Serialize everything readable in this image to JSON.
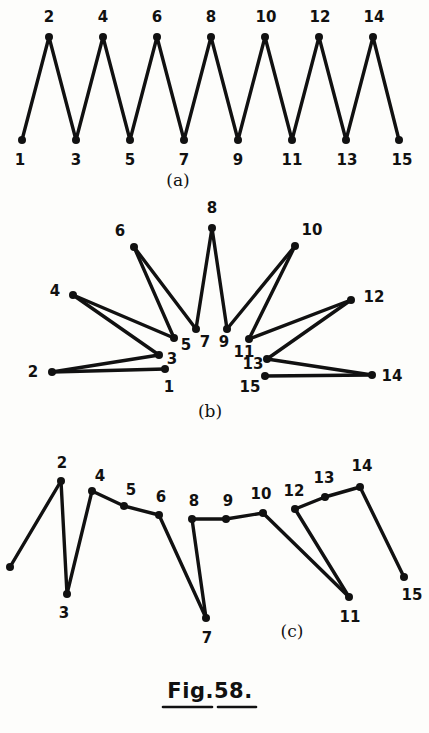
{
  "figure": {
    "caption": "Fig.58.",
    "caption_underlined": true,
    "background_color": "#fdfdfb",
    "ink_color": "#111111",
    "style": "hand-drawn pen sketch",
    "panels": [
      {
        "id": "a",
        "caption": "(a)",
        "caption_pos": [
          178,
          181
        ],
        "description": "zigzag path 1-2-3-...-15, odd vertices on lower row, even vertices on upper row",
        "nodes": [
          {
            "label": "1",
            "x": 22,
            "y": 140,
            "label_x": 20,
            "label_y": 160
          },
          {
            "label": "2",
            "x": 49,
            "y": 37,
            "label_x": 49,
            "label_y": 17
          },
          {
            "label": "3",
            "x": 76,
            "y": 140,
            "label_x": 76,
            "label_y": 160
          },
          {
            "label": "4",
            "x": 103,
            "y": 37,
            "label_x": 103,
            "label_y": 17
          },
          {
            "label": "5",
            "x": 130,
            "y": 140,
            "label_x": 130,
            "label_y": 160
          },
          {
            "label": "6",
            "x": 157,
            "y": 37,
            "label_x": 157,
            "label_y": 17
          },
          {
            "label": "7",
            "x": 184,
            "y": 140,
            "label_x": 184,
            "label_y": 160
          },
          {
            "label": "8",
            "x": 211,
            "y": 37,
            "label_x": 211,
            "label_y": 17
          },
          {
            "label": "9",
            "x": 238,
            "y": 140,
            "label_x": 238,
            "label_y": 160
          },
          {
            "label": "10",
            "x": 265,
            "y": 37,
            "label_x": 266,
            "label_y": 17
          },
          {
            "label": "11",
            "x": 292,
            "y": 140,
            "label_x": 292,
            "label_y": 160
          },
          {
            "label": "12",
            "x": 319,
            "y": 37,
            "label_x": 320,
            "label_y": 17
          },
          {
            "label": "13",
            "x": 346,
            "y": 140,
            "label_x": 347,
            "label_y": 160
          },
          {
            "label": "14",
            "x": 373,
            "y": 37,
            "label_x": 374,
            "label_y": 17
          },
          {
            "label": "15",
            "x": 399,
            "y": 140,
            "label_x": 402,
            "label_y": 160
          }
        ],
        "edges": [
          [
            "1",
            "2"
          ],
          [
            "2",
            "3"
          ],
          [
            "3",
            "4"
          ],
          [
            "4",
            "5"
          ],
          [
            "5",
            "6"
          ],
          [
            "6",
            "7"
          ],
          [
            "7",
            "8"
          ],
          [
            "8",
            "9"
          ],
          [
            "9",
            "10"
          ],
          [
            "10",
            "11"
          ],
          [
            "11",
            "12"
          ],
          [
            "12",
            "13"
          ],
          [
            "13",
            "14"
          ],
          [
            "14",
            "15"
          ]
        ]
      },
      {
        "id": "b",
        "caption": "(b)",
        "caption_pos": [
          210,
          412
        ],
        "description": "same path 1-2-...-15 redrawn as a radial fan; odd vertices clustered near centre, even vertices splayed outward",
        "nodes": [
          {
            "label": "1",
            "x": 165,
            "y": 369,
            "label_x": 169,
            "label_y": 387
          },
          {
            "label": "2",
            "x": 52,
            "y": 372,
            "label_x": 33,
            "label_y": 372
          },
          {
            "label": "3",
            "x": 159,
            "y": 355,
            "label_x": 172,
            "label_y": 359
          },
          {
            "label": "4",
            "x": 73,
            "y": 295,
            "label_x": 55,
            "label_y": 291
          },
          {
            "label": "5",
            "x": 174,
            "y": 338,
            "label_x": 186,
            "label_y": 345
          },
          {
            "label": "6",
            "x": 134,
            "y": 247,
            "label_x": 120,
            "label_y": 231
          },
          {
            "label": "7",
            "x": 196,
            "y": 329,
            "label_x": 205,
            "label_y": 342
          },
          {
            "label": "8",
            "x": 212,
            "y": 228,
            "label_x": 212,
            "label_y": 208
          },
          {
            "label": "9",
            "x": 227,
            "y": 329,
            "label_x": 224,
            "label_y": 342
          },
          {
            "label": "10",
            "x": 295,
            "y": 246,
            "label_x": 312,
            "label_y": 230
          },
          {
            "label": "11",
            "x": 249,
            "y": 339,
            "label_x": 244,
            "label_y": 352
          },
          {
            "label": "12",
            "x": 351,
            "y": 300,
            "label_x": 374,
            "label_y": 297
          },
          {
            "label": "13",
            "x": 267,
            "y": 359,
            "label_x": 253,
            "label_y": 364
          },
          {
            "label": "14",
            "x": 372,
            "y": 375,
            "label_x": 392,
            "label_y": 376
          },
          {
            "label": "15",
            "x": 265,
            "y": 376,
            "label_x": 250,
            "label_y": 387
          }
        ],
        "edges": [
          [
            "1",
            "2"
          ],
          [
            "2",
            "3"
          ],
          [
            "3",
            "4"
          ],
          [
            "4",
            "5"
          ],
          [
            "5",
            "6"
          ],
          [
            "6",
            "7"
          ],
          [
            "7",
            "8"
          ],
          [
            "8",
            "9"
          ],
          [
            "9",
            "10"
          ],
          [
            "10",
            "11"
          ],
          [
            "11",
            "12"
          ],
          [
            "12",
            "13"
          ],
          [
            "13",
            "14"
          ],
          [
            "14",
            "15"
          ]
        ]
      },
      {
        "id": "c",
        "caption": "(c)",
        "caption_pos": [
          292,
          632
        ],
        "description": "same path redrawn with three deep vertices 3, 7 and 11 acting as fan hubs",
        "nodes": [
          {
            "label": "1",
            "x": 10,
            "y": 567,
            "label_x": -6,
            "label_y": 585
          },
          {
            "label": "2",
            "x": 61,
            "y": 481,
            "label_x": 62,
            "label_y": 463
          },
          {
            "label": "3",
            "x": 67,
            "y": 594,
            "label_x": 64,
            "label_y": 613
          },
          {
            "label": "4",
            "x": 92,
            "y": 491,
            "label_x": 100,
            "label_y": 476
          },
          {
            "label": "5",
            "x": 124,
            "y": 506,
            "label_x": 131,
            "label_y": 490
          },
          {
            "label": "6",
            "x": 159,
            "y": 515,
            "label_x": 161,
            "label_y": 497
          },
          {
            "label": "7",
            "x": 206,
            "y": 618,
            "label_x": 207,
            "label_y": 638
          },
          {
            "label": "8",
            "x": 192,
            "y": 519,
            "label_x": 194,
            "label_y": 501
          },
          {
            "label": "9",
            "x": 226,
            "y": 519,
            "label_x": 228,
            "label_y": 501
          },
          {
            "label": "10",
            "x": 263,
            "y": 513,
            "label_x": 261,
            "label_y": 494
          },
          {
            "label": "11",
            "x": 349,
            "y": 597,
            "label_x": 350,
            "label_y": 617
          },
          {
            "label": "12",
            "x": 295,
            "y": 509,
            "label_x": 294,
            "label_y": 491
          },
          {
            "label": "13",
            "x": 325,
            "y": 497,
            "label_x": 324,
            "label_y": 478
          },
          {
            "label": "14",
            "x": 360,
            "y": 487,
            "label_x": 362,
            "label_y": 466
          },
          {
            "label": "15",
            "x": 404,
            "y": 577,
            "label_x": 412,
            "label_y": 595
          }
        ],
        "edges": [
          [
            "1",
            "2"
          ],
          [
            "2",
            "3"
          ],
          [
            "3",
            "4"
          ],
          [
            "4",
            "5"
          ],
          [
            "5",
            "6"
          ],
          [
            "6",
            "7"
          ],
          [
            "7",
            "8"
          ],
          [
            "8",
            "9"
          ],
          [
            "9",
            "10"
          ],
          [
            "10",
            "11"
          ],
          [
            "11",
            "12"
          ],
          [
            "12",
            "13"
          ],
          [
            "13",
            "14"
          ],
          [
            "14",
            "15"
          ]
        ]
      }
    ],
    "fig_caption_pos": [
      210,
      692
    ],
    "fig_underline": [
      [
        163,
        707,
        212,
        707
      ],
      [
        218,
        707,
        256,
        707
      ]
    ]
  }
}
